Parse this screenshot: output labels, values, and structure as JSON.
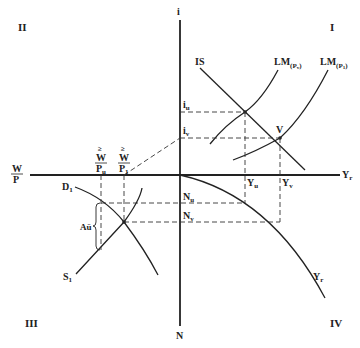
{
  "quadrants": {
    "q1": "I",
    "q2": "II",
    "q3": "III",
    "q4": "IV"
  },
  "axes": {
    "vertical_top": "i",
    "vertical_bottom": "N",
    "horizontal_right": "Y",
    "horizontal_right_sub": "r",
    "horizontal_left_num": "W",
    "horizontal_left_den": "P"
  },
  "curves": {
    "is": "IS",
    "lm_v": "LM",
    "lm_v_sub": "(P",
    "lm_v_subsub": "v",
    "lm_v_close": ")",
    "lm_1": "LM",
    "lm_1_sub": "(P",
    "lm_1_subsub": "1",
    "lm_1_close": ")",
    "labor_demand": "D",
    "labor_demand_sub": "1",
    "labor_supply": "S",
    "labor_supply_sub": "1",
    "production": "Y",
    "production_sub": "r"
  },
  "points": {
    "v": "V"
  },
  "ticks": {
    "i_u": "i",
    "i_u_sub": "u",
    "i_v": "i",
    "i_v_sub": "v",
    "y_u": "Y",
    "y_u_sub": "u",
    "y_v": "Y",
    "y_v_sub": "v",
    "n_u": "N",
    "n_u_sub": "u",
    "n_v": "N",
    "n_v_sub": "v",
    "w_pu_top": "≥",
    "w_pu_num": "W",
    "w_pu_den": "P",
    "w_pu_den_sub": "u",
    "w_p1_top": "≥",
    "w_p1_num": "W",
    "w_p1_den": "P",
    "w_p1_den_sub": "1"
  },
  "annotations": {
    "unemployment_gap": "Aü"
  }
}
